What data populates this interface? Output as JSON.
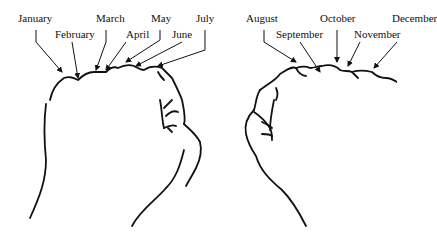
{
  "diagram": {
    "left_fist": {
      "labels": [
        {
          "text": "January",
          "x": 18,
          "y": 18
        },
        {
          "text": "February",
          "x": 55,
          "y": 30
        },
        {
          "text": "March",
          "x": 96,
          "y": 18
        },
        {
          "text": "April",
          "x": 126,
          "y": 30
        },
        {
          "text": "May",
          "x": 151,
          "y": 18
        },
        {
          "text": "June",
          "x": 172,
          "y": 30
        },
        {
          "text": "July",
          "x": 196,
          "y": 18
        }
      ]
    },
    "right_fist": {
      "labels": [
        {
          "text": "August",
          "x": 246,
          "y": 18
        },
        {
          "text": "September",
          "x": 276,
          "y": 30
        },
        {
          "text": "October",
          "x": 320,
          "y": 18
        },
        {
          "text": "November",
          "x": 354,
          "y": 30
        },
        {
          "text": "December",
          "x": 392,
          "y": 18
        }
      ]
    }
  }
}
